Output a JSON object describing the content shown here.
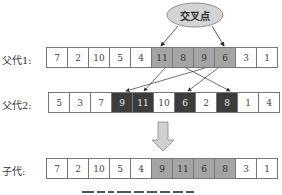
{
  "crossover_point_label": "交叉点",
  "colors": {
    "segment_gray": "#a4a4a4",
    "segment_dark": "#3c3c3c",
    "ellipse_fill": "#d4d4d4",
    "arrow_fill": "#d0d0d0"
  },
  "rows": [
    {
      "label": "父代1:",
      "cells": [
        {
          "value": "7",
          "style": "plain"
        },
        {
          "value": "2",
          "style": "plain"
        },
        {
          "value": "10",
          "style": "plain"
        },
        {
          "value": "5",
          "style": "plain"
        },
        {
          "value": "4",
          "style": "plain"
        },
        {
          "value": "11",
          "style": "gray"
        },
        {
          "value": "8",
          "style": "gray"
        },
        {
          "value": "9",
          "style": "gray"
        },
        {
          "value": "6",
          "style": "gray"
        },
        {
          "value": "3",
          "style": "plain"
        },
        {
          "value": "1",
          "style": "plain"
        }
      ]
    },
    {
      "label": "父代2:",
      "cells": [
        {
          "value": "5",
          "style": "plain"
        },
        {
          "value": "3",
          "style": "plain"
        },
        {
          "value": "7",
          "style": "plain"
        },
        {
          "value": "9",
          "style": "dark"
        },
        {
          "value": "11",
          "style": "dark"
        },
        {
          "value": "10",
          "style": "plain"
        },
        {
          "value": "6",
          "style": "dark"
        },
        {
          "value": "2",
          "style": "plain"
        },
        {
          "value": "8",
          "style": "dark"
        },
        {
          "value": "1",
          "style": "plain"
        },
        {
          "value": "4",
          "style": "plain"
        }
      ]
    },
    {
      "label": "子代:",
      "cells": [
        {
          "value": "7",
          "style": "plain"
        },
        {
          "value": "2",
          "style": "plain"
        },
        {
          "value": "10",
          "style": "plain"
        },
        {
          "value": "5",
          "style": "plain"
        },
        {
          "value": "4",
          "style": "plain"
        },
        {
          "value": "9",
          "style": "gray"
        },
        {
          "value": "11",
          "style": "gray"
        },
        {
          "value": "6",
          "style": "gray"
        },
        {
          "value": "8",
          "style": "gray"
        },
        {
          "value": "3",
          "style": "plain"
        },
        {
          "value": "1",
          "style": "plain"
        }
      ]
    }
  ]
}
